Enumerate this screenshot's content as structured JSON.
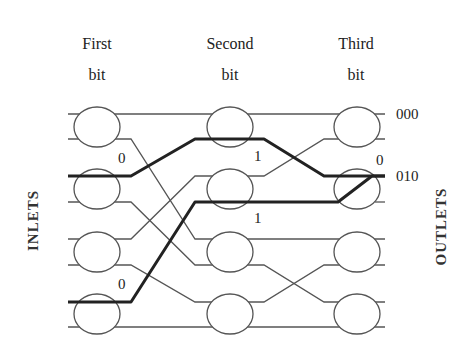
{
  "headers": [
    {
      "line1": "First",
      "line2": "bit"
    },
    {
      "line1": "Second",
      "line2": "bit"
    },
    {
      "line1": "Third",
      "line2": "bit"
    }
  ],
  "side_labels": {
    "left": "INLETS",
    "right": "OUTLETS"
  },
  "outlet_labels": [
    {
      "text": "000",
      "row": 0
    },
    {
      "text": "010",
      "row": 2
    }
  ],
  "bit_labels": [
    {
      "text": "0",
      "stage": 1,
      "note": "first bit of path from inlet 2"
    },
    {
      "text": "0",
      "stage": 1,
      "note": "first bit of path from inlet 6"
    },
    {
      "text": "1",
      "stage": 2,
      "note": "second bit upper path"
    },
    {
      "text": "1",
      "stage": 2,
      "note": "second bit lower path"
    },
    {
      "text": "0",
      "stage": 3,
      "note": "third bit (conflict at outlet 010)"
    }
  ],
  "stages": 3,
  "switches_per_stage": 4,
  "colors": {
    "line": "#555555",
    "path": "#222222",
    "background": "#ffffff"
  }
}
